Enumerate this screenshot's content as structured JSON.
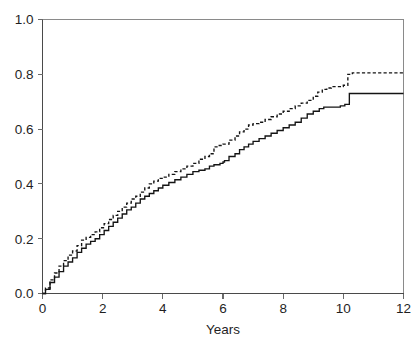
{
  "chart_data": {
    "type": "line",
    "title": "",
    "subtitle": "",
    "xlabel": "Years",
    "ylabel": "",
    "xlim": [
      0,
      12
    ],
    "ylim": [
      0.0,
      1.0
    ],
    "grid": false,
    "legend": "none",
    "x_ticks": [
      0,
      2,
      4,
      6,
      8,
      10,
      12
    ],
    "x_tick_labels": [
      "0",
      "2",
      "4",
      "6",
      "8",
      "10",
      "12"
    ],
    "y_ticks": [
      0.0,
      0.2,
      0.4,
      0.6,
      0.8,
      1.0
    ],
    "y_tick_labels": [
      "0.0",
      "0.2",
      "0.4",
      "0.6",
      "0.8",
      "1.0"
    ],
    "step_style": "post",
    "series": [
      {
        "name": "dashed-curve",
        "style": "dashed",
        "color": "#141414",
        "x": [
          0,
          0.1,
          0.25,
          0.4,
          0.55,
          0.7,
          0.85,
          1.0,
          1.15,
          1.3,
          1.45,
          1.6,
          1.75,
          1.9,
          2.05,
          2.2,
          2.35,
          2.5,
          2.65,
          2.8,
          2.95,
          3.1,
          3.25,
          3.4,
          3.55,
          3.7,
          3.85,
          4.0,
          4.2,
          4.4,
          4.6,
          4.8,
          5.0,
          5.2,
          5.4,
          5.55,
          5.7,
          5.8,
          6.0,
          6.2,
          6.4,
          6.55,
          6.7,
          6.85,
          7.0,
          7.2,
          7.4,
          7.6,
          7.8,
          8.0,
          8.2,
          8.4,
          8.6,
          8.8,
          9.0,
          9.15,
          9.3,
          9.45,
          9.6,
          9.8,
          10.0,
          10.15,
          10.3,
          11.0,
          12.0
        ],
        "y": [
          0.0,
          0.02,
          0.05,
          0.075,
          0.1,
          0.12,
          0.14,
          0.155,
          0.175,
          0.195,
          0.205,
          0.215,
          0.225,
          0.24,
          0.255,
          0.27,
          0.285,
          0.3,
          0.315,
          0.33,
          0.345,
          0.355,
          0.37,
          0.385,
          0.4,
          0.41,
          0.42,
          0.425,
          0.435,
          0.445,
          0.455,
          0.465,
          0.475,
          0.49,
          0.5,
          0.51,
          0.535,
          0.54,
          0.545,
          0.56,
          0.575,
          0.59,
          0.6,
          0.615,
          0.62,
          0.625,
          0.635,
          0.645,
          0.655,
          0.665,
          0.675,
          0.685,
          0.695,
          0.705,
          0.72,
          0.735,
          0.745,
          0.75,
          0.755,
          0.755,
          0.76,
          0.8,
          0.805,
          0.805,
          0.805
        ]
      },
      {
        "name": "solid-curve",
        "style": "solid",
        "color": "#141414",
        "x": [
          0,
          0.1,
          0.25,
          0.4,
          0.55,
          0.7,
          0.85,
          1.0,
          1.15,
          1.3,
          1.45,
          1.6,
          1.75,
          1.9,
          2.05,
          2.2,
          2.35,
          2.5,
          2.65,
          2.8,
          2.95,
          3.1,
          3.25,
          3.4,
          3.55,
          3.7,
          3.85,
          4.0,
          4.2,
          4.4,
          4.6,
          4.8,
          5.0,
          5.2,
          5.4,
          5.55,
          5.7,
          5.9,
          6.0,
          6.05,
          6.2,
          6.4,
          6.55,
          6.7,
          6.85,
          7.0,
          7.2,
          7.4,
          7.6,
          7.8,
          8.0,
          8.2,
          8.4,
          8.6,
          8.8,
          9.0,
          9.2,
          9.35,
          9.5,
          9.7,
          9.9,
          10.05,
          10.2,
          10.35,
          11.0,
          12.0
        ],
        "y": [
          0.0,
          0.015,
          0.04,
          0.06,
          0.08,
          0.1,
          0.115,
          0.13,
          0.15,
          0.165,
          0.18,
          0.19,
          0.2,
          0.215,
          0.23,
          0.245,
          0.26,
          0.275,
          0.29,
          0.305,
          0.315,
          0.33,
          0.345,
          0.355,
          0.365,
          0.375,
          0.385,
          0.395,
          0.405,
          0.415,
          0.425,
          0.435,
          0.445,
          0.45,
          0.455,
          0.465,
          0.47,
          0.475,
          0.48,
          0.485,
          0.5,
          0.51,
          0.525,
          0.535,
          0.545,
          0.555,
          0.565,
          0.575,
          0.585,
          0.595,
          0.605,
          0.615,
          0.625,
          0.64,
          0.655,
          0.665,
          0.675,
          0.68,
          0.68,
          0.68,
          0.685,
          0.69,
          0.73,
          0.73,
          0.73,
          0.73
        ]
      }
    ]
  },
  "axes": {
    "x_title": "Years"
  }
}
